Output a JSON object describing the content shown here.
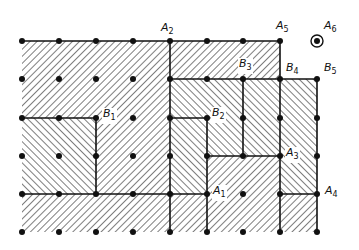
{
  "diagram": {
    "grid": {
      "cols": [
        22,
        59,
        96,
        133,
        170,
        207,
        243,
        280,
        317
      ],
      "rows": [
        41,
        79,
        118,
        156,
        194,
        232
      ]
    },
    "colors": {
      "ink": "#111111",
      "background": "#ffffff"
    },
    "regions": [
      {
        "id": "top-left",
        "hatch": "forward",
        "poly": [
          [
            0,
            0
          ],
          [
            4,
            0
          ],
          [
            4,
            4
          ],
          [
            2,
            4
          ],
          [
            2,
            2
          ],
          [
            0,
            2
          ]
        ]
      },
      {
        "id": "top-right-B3",
        "hatch": "forward",
        "poly": [
          [
            4,
            0
          ],
          [
            7,
            0
          ],
          [
            7,
            1
          ],
          [
            4,
            1
          ]
        ]
      },
      {
        "id": "B1-box",
        "hatch": "backward",
        "poly": [
          [
            0,
            2
          ],
          [
            2,
            2
          ],
          [
            2,
            4
          ],
          [
            0,
            4
          ]
        ]
      },
      {
        "id": "mid-B2",
        "hatch": "backward",
        "poly": [
          [
            4,
            1
          ],
          [
            6,
            1
          ],
          [
            6,
            3
          ],
          [
            5,
            3
          ],
          [
            5,
            4
          ],
          [
            4,
            4
          ]
        ]
      },
      {
        "id": "right-col-6",
        "hatch": "backward",
        "poly": [
          [
            6,
            1
          ],
          [
            7,
            1
          ],
          [
            7,
            3
          ],
          [
            6,
            3
          ]
        ]
      },
      {
        "id": "right-col-7",
        "hatch": "backward",
        "poly": [
          [
            7,
            1
          ],
          [
            8,
            1
          ],
          [
            8,
            4
          ],
          [
            7,
            4
          ]
        ]
      },
      {
        "id": "bottom-band",
        "hatch": "forward",
        "poly": [
          [
            0,
            4
          ],
          [
            5,
            4
          ],
          [
            5,
            3
          ],
          [
            7,
            3
          ],
          [
            7,
            5
          ],
          [
            0,
            5
          ]
        ]
      },
      {
        "id": "bottom-right",
        "hatch": "forward",
        "poly": [
          [
            7,
            4
          ],
          [
            8,
            4
          ],
          [
            8,
            5
          ],
          [
            7,
            5
          ]
        ]
      }
    ],
    "edges": [
      [
        [
          0,
          0
        ],
        [
          7,
          0
        ]
      ],
      [
        [
          4,
          0
        ],
        [
          4,
          5
        ]
      ],
      [
        [
          7,
          0
        ],
        [
          7,
          5
        ]
      ],
      [
        [
          4,
          1
        ],
        [
          8,
          1
        ]
      ],
      [
        [
          8,
          1
        ],
        [
          8,
          5
        ]
      ],
      [
        [
          6,
          1
        ],
        [
          6,
          3
        ]
      ],
      [
        [
          0,
          2
        ],
        [
          2,
          2
        ]
      ],
      [
        [
          2,
          2
        ],
        [
          2,
          4
        ]
      ],
      [
        [
          4,
          2
        ],
        [
          5,
          2
        ]
      ],
      [
        [
          5,
          2
        ],
        [
          5,
          5
        ]
      ],
      [
        [
          5,
          3
        ],
        [
          7,
          3
        ]
      ],
      [
        [
          0,
          4
        ],
        [
          5,
          4
        ]
      ],
      [
        [
          7,
          4
        ],
        [
          8,
          4
        ]
      ]
    ],
    "points": [
      [
        0,
        0
      ],
      [
        1,
        0
      ],
      [
        2,
        0
      ],
      [
        3,
        0
      ],
      [
        4,
        0
      ],
      [
        5,
        0
      ],
      [
        6,
        0
      ],
      [
        7,
        0
      ],
      [
        0,
        1
      ],
      [
        1,
        1
      ],
      [
        2,
        1
      ],
      [
        3,
        1
      ],
      [
        4,
        1
      ],
      [
        5,
        1
      ],
      [
        6,
        1
      ],
      [
        7,
        1
      ],
      [
        8,
        1
      ],
      [
        0,
        2
      ],
      [
        1,
        2
      ],
      [
        2,
        2
      ],
      [
        3,
        2
      ],
      [
        4,
        2
      ],
      [
        5,
        2
      ],
      [
        6,
        2
      ],
      [
        7,
        2
      ],
      [
        8,
        2
      ],
      [
        0,
        3
      ],
      [
        1,
        3
      ],
      [
        2,
        3
      ],
      [
        3,
        3
      ],
      [
        4,
        3
      ],
      [
        5,
        3
      ],
      [
        6,
        3
      ],
      [
        7,
        3
      ],
      [
        8,
        3
      ],
      [
        0,
        4
      ],
      [
        1,
        4
      ],
      [
        2,
        4
      ],
      [
        3,
        4
      ],
      [
        4,
        4
      ],
      [
        5,
        4
      ],
      [
        6,
        4
      ],
      [
        7,
        4
      ],
      [
        8,
        4
      ],
      [
        0,
        5
      ],
      [
        1,
        5
      ],
      [
        2,
        5
      ],
      [
        3,
        5
      ],
      [
        4,
        5
      ],
      [
        5,
        5
      ],
      [
        6,
        5
      ],
      [
        7,
        5
      ],
      [
        8,
        5
      ]
    ],
    "circled_point": [
      8,
      0
    ],
    "labels": [
      {
        "id": "A1",
        "letter": "A",
        "sub": "1",
        "x": 212,
        "y": 185
      },
      {
        "id": "A2",
        "letter": "A",
        "sub": "2",
        "x": 160,
        "y": 22
      },
      {
        "id": "A3",
        "letter": "A",
        "sub": "3",
        "x": 285,
        "y": 147
      },
      {
        "id": "A4",
        "letter": "A",
        "sub": "4",
        "x": 324,
        "y": 185
      },
      {
        "id": "A5",
        "letter": "A",
        "sub": "5",
        "x": 275,
        "y": 20
      },
      {
        "id": "A6",
        "letter": "A",
        "sub": "6",
        "x": 323,
        "y": 20
      },
      {
        "id": "B1",
        "letter": "B",
        "sub": "1",
        "x": 102,
        "y": 108
      },
      {
        "id": "B2",
        "letter": "B",
        "sub": "2",
        "x": 211,
        "y": 107
      },
      {
        "id": "B3",
        "letter": "B",
        "sub": "3",
        "x": 238,
        "y": 58
      },
      {
        "id": "B4",
        "letter": "B",
        "sub": "4",
        "x": 285,
        "y": 62
      },
      {
        "id": "B5",
        "letter": "B",
        "sub": "5",
        "x": 323,
        "y": 62
      }
    ]
  }
}
